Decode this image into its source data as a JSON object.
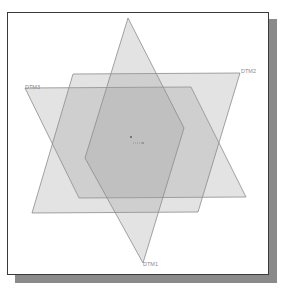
{
  "viewport": {
    "background": "#ffffff",
    "frame_border": "#3a3a3a",
    "shadow": "#8a8a8a"
  },
  "datum_planes": [
    {
      "name": "DTM1",
      "label": "DTM1",
      "points": "128,18 184,128 143,263 85,158",
      "label_x": 143,
      "label_y": 266
    },
    {
      "name": "DTM2",
      "label": "DTM2",
      "points": "73,74 240,73 198,212 32,213",
      "label_x": 241,
      "label_y": 73
    },
    {
      "name": "DTM3",
      "label": "DTM3",
      "points": "25,88 191,87 246,197 79,198",
      "label_x": 25,
      "label_y": 89
    }
  ],
  "origin": {
    "point_a": {
      "x": 131,
      "y": 137
    },
    "point_b": {
      "x": 143,
      "y": 143
    }
  }
}
